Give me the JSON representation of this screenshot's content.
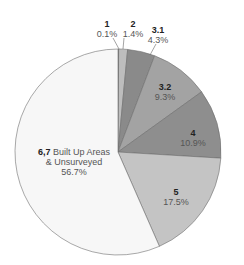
{
  "chart_data": {
    "type": "pie",
    "title": "",
    "start_angle_deg": 0,
    "direction": "clockwise",
    "categories": [
      "1",
      "2",
      "3.1",
      "3.2",
      "4",
      "5",
      "6,7 Built Up Areas & Unsurveyed"
    ],
    "values": [
      0.1,
      1.4,
      4.3,
      9.3,
      10.9,
      17.5,
      56.7
    ],
    "unit": "%",
    "slices": [
      {
        "label": "1",
        "value": 0.1,
        "percent_text": "0.1%",
        "color": "#2b2b2b"
      },
      {
        "label": "2",
        "value": 1.4,
        "percent_text": "1.4%",
        "color": "#bdbdbd"
      },
      {
        "label": "3.1",
        "value": 4.3,
        "percent_text": "4.3%",
        "color": "#8a8a8a"
      },
      {
        "label": "3.2",
        "value": 9.3,
        "percent_text": "9.3%",
        "color": "#a3a3a3"
      },
      {
        "label": "4",
        "value": 10.9,
        "percent_text": "10.9%",
        "color": "#8e8e8e"
      },
      {
        "label": "5",
        "value": 17.5,
        "percent_text": "17.5%",
        "color": "#c4c4c4"
      },
      {
        "label": "6,7",
        "label_extra": "Built Up Areas",
        "label_line2": "& Unsurveyed",
        "value": 56.7,
        "percent_text": "56.7%",
        "color": "#f7f7f7"
      }
    ],
    "legend": null,
    "grid": false
  },
  "labels": {
    "s1": {
      "cat": "1",
      "pct": "0.1%"
    },
    "s2": {
      "cat": "2",
      "pct": "1.4%"
    },
    "s31": {
      "cat": "3.1",
      "pct": "4.3%"
    },
    "s32": {
      "cat": "3.2",
      "pct": "9.3%"
    },
    "s4": {
      "cat": "4",
      "pct": "10.9%"
    },
    "s5": {
      "cat": "5",
      "pct": "17.5%"
    },
    "s67": {
      "cat": "6,7",
      "extra": " Built Up Areas",
      "line2": "& Unsurveyed",
      "pct": "56.7%"
    }
  }
}
